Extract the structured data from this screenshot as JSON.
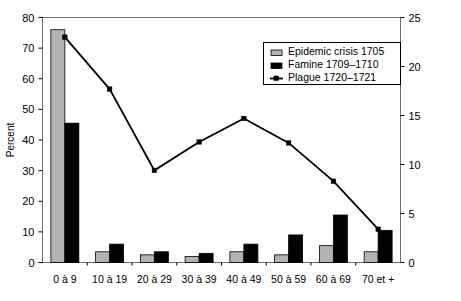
{
  "chart_data": {
    "type": "bar",
    "title": "",
    "subtitle": "",
    "categories": [
      "0 à 9",
      "10 à 19",
      "20 à 29",
      "30 à 39",
      "40 à 49",
      "50 à 59",
      "60 à 69",
      "70 et +"
    ],
    "xlabel": "",
    "ylabel": "Percent",
    "ylim": [
      0,
      80
    ],
    "yticks": [
      0,
      10,
      20,
      30,
      40,
      50,
      60,
      70,
      80
    ],
    "y2label": "",
    "y2lim": [
      0,
      25
    ],
    "y2ticks": [
      0,
      5,
      10,
      15,
      20,
      25
    ],
    "grid": false,
    "legend_position": "top-right",
    "series": [
      {
        "name": "Epidemic crisis 1705",
        "type": "bar",
        "axis": "left",
        "color": "#b3b3b3",
        "values": [
          76,
          3.5,
          2.5,
          2,
          3.5,
          2.5,
          5.5,
          3.5
        ]
      },
      {
        "name": "Famine 1709–1710",
        "type": "bar",
        "axis": "left",
        "color": "#000000",
        "values": [
          45.5,
          6,
          3.5,
          3,
          6,
          9,
          15.5,
          10.5
        ]
      },
      {
        "name": "Plague 1720–1721",
        "type": "line",
        "axis": "right",
        "color": "#000000",
        "values": [
          23,
          17.7,
          9.4,
          12.3,
          14.7,
          12.2,
          8.3,
          3.4
        ]
      }
    ]
  },
  "axes": {
    "left_title": "Percent",
    "left_ticks": [
      "0",
      "10",
      "20",
      "30",
      "40",
      "50",
      "60",
      "70",
      "80"
    ],
    "right_ticks": [
      "0",
      "5",
      "10",
      "15",
      "20",
      "25"
    ],
    "category_labels": [
      "0 à 9",
      "10 à 19",
      "20 à 29",
      "30 à 39",
      "40 à 49",
      "50 à 59",
      "60 à 69",
      "70 et +"
    ]
  },
  "legend": {
    "items": [
      {
        "label": "Epidemic crisis 1705",
        "marker": "gray-bar-swatch"
      },
      {
        "label": "Famine 1709–1710",
        "marker": "black-bar-swatch"
      },
      {
        "label": "Plague 1720–1721",
        "marker": "line-point-marker"
      }
    ]
  }
}
